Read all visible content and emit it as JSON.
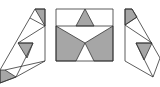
{
  "figure": {
    "colors": {
      "fill": "#a6a6a6",
      "stroke": "#333333",
      "background": "#ffffff"
    },
    "panels": [
      {
        "name": "left-net"
      },
      {
        "name": "center-rectangle"
      },
      {
        "name": "right-net"
      }
    ]
  }
}
